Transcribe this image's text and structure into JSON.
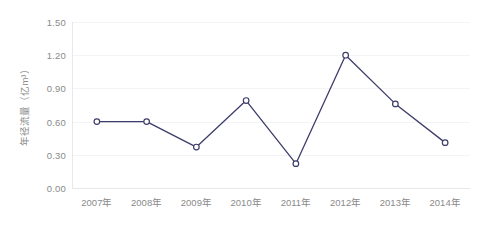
{
  "chart_data": {
    "type": "line",
    "title": "",
    "subtitle": "",
    "xlabel": "",
    "ylabel": "年径流量（亿m³）",
    "categories": [
      "2007年",
      "2008年",
      "2009年",
      "2010年",
      "2011年",
      "2012年",
      "2013年",
      "2014年"
    ],
    "values": [
      0.6,
      0.6,
      0.37,
      0.79,
      0.22,
      1.2,
      0.76,
      0.41
    ],
    "series": [
      {
        "name": "年径流量",
        "values": [
          0.6,
          0.6,
          0.37,
          0.79,
          0.22,
          1.2,
          0.76,
          0.41
        ]
      }
    ],
    "ylim": [
      0.0,
      1.5
    ],
    "ytick_labels": [
      "1.50",
      "1.20",
      "0.90",
      "0.60",
      "0.30",
      "0.00"
    ],
    "ytick_values": [
      1.5,
      1.2,
      0.9,
      0.6,
      0.3,
      0.0
    ],
    "grid": true,
    "legend": "none",
    "marker": "circle-open",
    "colors": {
      "line": "#3d3d6b",
      "marker_fill": "#ffffff",
      "marker_stroke": "#3d3d6b",
      "grid": "#f4f4f6",
      "axis": "#e8e8ec",
      "tick_text": "#8a8a8a",
      "background": "#ffffff"
    }
  }
}
